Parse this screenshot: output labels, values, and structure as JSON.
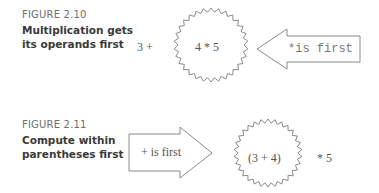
{
  "figures": [
    {
      "label": "FIGURE 2.10",
      "title_line1": "Multiplication gets",
      "title_line2": "its operands first",
      "left_text": "3 +",
      "burst_text": "4 * 5",
      "arrow_text": "*is first",
      "arrow_direction": "left"
    },
    {
      "label": "FIGURE 2.11",
      "title_line1": "Compute within",
      "title_line2": "parentheses first",
      "arrow_text": "+ is first",
      "arrow_direction": "right",
      "burst_text": "(3 + 4)",
      "right_text": "* 5"
    }
  ],
  "colors": {
    "stroke": "#8a8a8a",
    "label": "#6d6e70",
    "title": "#3a3a3a"
  }
}
